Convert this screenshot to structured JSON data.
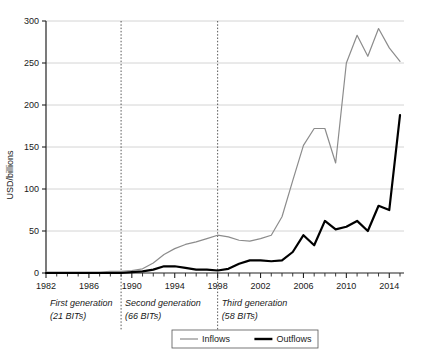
{
  "chart_data": {
    "type": "line",
    "title": "",
    "xlabel": "",
    "ylabel": "USD/billions",
    "ylim": [
      0,
      300
    ],
    "xlim": [
      1982,
      2015
    ],
    "ytick_values": [
      0,
      50,
      100,
      150,
      200,
      250,
      300
    ],
    "ytick_labels": [
      "0",
      "50",
      "100",
      "150",
      "200",
      "250",
      "300"
    ],
    "xtick_labels": [
      "1982",
      "1986",
      "1990",
      "1994",
      "1998",
      "2002",
      "2006",
      "2010",
      "2014"
    ],
    "xtick_values": [
      1982,
      1986,
      1990,
      1994,
      1998,
      2002,
      2006,
      2010,
      2014
    ],
    "minor_xticks_every": 1,
    "grid": "horizontal",
    "legend_position": "bottom-center",
    "x": [
      1982,
      1983,
      1984,
      1985,
      1986,
      1987,
      1988,
      1989,
      1990,
      1991,
      1992,
      1993,
      1994,
      1995,
      1996,
      1997,
      1998,
      1999,
      2000,
      2001,
      2002,
      2003,
      2004,
      2005,
      2006,
      2007,
      2008,
      2009,
      2010,
      2011,
      2012,
      2013,
      2014,
      2015
    ],
    "series": [
      {
        "name": "Inflows",
        "color": "#8c8c8c",
        "values": [
          1,
          1,
          1,
          1,
          1,
          1,
          2,
          2,
          3,
          5,
          12,
          22,
          29,
          34,
          37,
          41,
          45,
          43,
          39,
          38,
          41,
          45,
          67,
          110,
          152,
          172,
          172,
          131,
          250,
          283,
          258,
          291,
          268,
          252
        ]
      },
      {
        "name": "Outflows",
        "color": "#000000",
        "values": [
          0,
          0,
          0,
          0,
          0,
          0,
          0,
          0,
          1,
          2,
          4,
          8,
          8,
          6,
          4,
          4,
          3,
          5,
          11,
          15,
          15,
          14,
          15,
          25,
          45,
          33,
          62,
          52,
          55,
          62,
          50,
          80,
          75,
          188
        ]
      }
    ],
    "annotations": [
      {
        "name": "first-generation",
        "line1": "First generation",
        "line2": "(21 BITs)",
        "x_start": 1982
      },
      {
        "name": "second-generation",
        "line1": "Second generation",
        "line2": "(66 BITs)",
        "x_start": 1989
      },
      {
        "name": "third-generation",
        "line1": "Third generation",
        "line2": "(58 BITs)",
        "x_start": 1998
      }
    ],
    "divider_years": [
      1989,
      1998
    ]
  },
  "legend": {
    "items": [
      {
        "label": "Inflows",
        "color": "#8c8c8c"
      },
      {
        "label": "Outflows",
        "color": "#000000"
      }
    ]
  }
}
